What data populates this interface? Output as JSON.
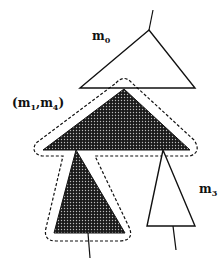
{
  "diagram": {
    "type": "tree-decomposition",
    "labels": {
      "top": {
        "base": "m",
        "sub": "0"
      },
      "group": {
        "open": "(",
        "a_base": "m",
        "a_sub": "1",
        "sep": ",",
        "b_base": "m",
        "b_sub": "4",
        "close": ")"
      },
      "right": {
        "base": "m",
        "sub": "3"
      }
    },
    "nodes": [
      {
        "id": "m0",
        "fill": "white"
      },
      {
        "id": "m1",
        "fill": "shaded",
        "group": "m1,m4"
      },
      {
        "id": "m4",
        "fill": "shaded",
        "group": "m1,m4"
      },
      {
        "id": "m3",
        "fill": "white"
      }
    ],
    "colors": {
      "stroke": "#111111",
      "shade": "#2a2a2a",
      "background": "#ffffff"
    }
  }
}
